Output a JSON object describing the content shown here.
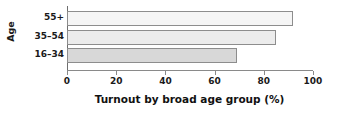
{
  "chart_data": {
    "type": "bar",
    "orientation": "horizontal",
    "title": "",
    "xlabel": "Turnout by broad age group (%)",
    "ylabel": "Age",
    "categories": [
      "55+",
      "35–54",
      "16–34"
    ],
    "values": [
      92,
      85,
      69
    ],
    "xlim": [
      0,
      100
    ],
    "xticks": [
      0,
      20,
      40,
      60,
      80,
      100
    ],
    "xtick_labels": [
      "0",
      "20",
      "40",
      "60",
      "80",
      "100"
    ],
    "grid": false,
    "legend": false,
    "bar_colors": [
      "#f5f5f5",
      "#ececec",
      "#d8d8d8"
    ],
    "bar_edge_color": "#8d8d8d",
    "axis_color": "#8a8a8a",
    "background": "#ffffff",
    "series": [
      {
        "name": "Turnout",
        "points": [
          {
            "category": "55+",
            "value": 92
          },
          {
            "category": "35–54",
            "value": 85
          },
          {
            "category": "16–34",
            "value": 69
          }
        ]
      }
    ]
  }
}
